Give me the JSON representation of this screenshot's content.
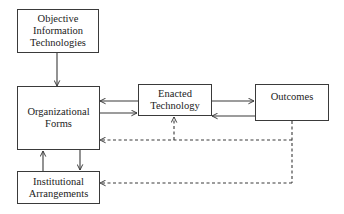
{
  "diagram": {
    "nodes": {
      "objective_it": {
        "lines": [
          "Objective",
          "Information",
          "Technologies"
        ]
      },
      "org_forms": {
        "lines": [
          "Organizational",
          "Forms"
        ]
      },
      "enacted_tech": {
        "lines": [
          "Enacted",
          "Technology"
        ]
      },
      "outcomes": {
        "lines": [
          "Outcomes"
        ]
      },
      "institutional": {
        "lines": [
          "Institutional",
          "Arrangements"
        ]
      }
    },
    "edges": [
      {
        "from": "Objective Information Technologies",
        "to": "Organizational Forms",
        "style": "solid"
      },
      {
        "from": "Enacted Technology",
        "to": "Organizational Forms",
        "style": "solid"
      },
      {
        "from": "Organizational Forms",
        "to": "Enacted Technology",
        "style": "solid"
      },
      {
        "from": "Enacted Technology",
        "to": "Outcomes",
        "style": "solid"
      },
      {
        "from": "Outcomes",
        "to": "Enacted Technology",
        "style": "solid"
      },
      {
        "from": "Organizational Forms",
        "to": "Institutional Arrangements",
        "style": "solid"
      },
      {
        "from": "Institutional Arrangements",
        "to": "Organizational Forms",
        "style": "solid"
      },
      {
        "from": "Outcomes",
        "to": "Organizational Forms",
        "style": "dashed"
      },
      {
        "from": "Outcomes",
        "to": "Enacted Technology",
        "style": "dashed"
      },
      {
        "from": "Outcomes",
        "to": "Institutional Arrangements",
        "style": "dashed"
      }
    ],
    "colors": {
      "line": "#3a3a3a",
      "background": "#ffffff"
    }
  }
}
